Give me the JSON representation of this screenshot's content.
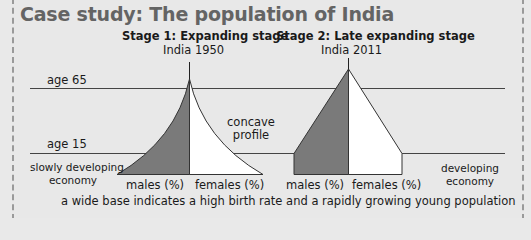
{
  "title": "Case study: The population of India",
  "stage1": {
    "heading": "Stage 1: Expanding stage",
    "subheading": "India 1950",
    "annotation_line1": "concave",
    "annotation_line2": "profile",
    "economy_line1": "slowly developing",
    "economy_line2": "economy",
    "males_label": "males (%)",
    "females_label": "females (%)"
  },
  "stage2": {
    "heading": "Stage 2: Late expanding stage",
    "subheading": "India 2011",
    "economy_line1": "developing",
    "economy_line2": "economy",
    "males_label": "males (%)",
    "females_label": "females (%)"
  },
  "age_lines": {
    "upper": "age 65",
    "lower": "age 15"
  },
  "caption": "a wide base indicates a high birth rate and a rapidly growing young population",
  "colors": {
    "title": "#646464",
    "males_fill": "#7a7a7a",
    "females_fill": "#ffffff",
    "background": "#e8e8e8"
  }
}
